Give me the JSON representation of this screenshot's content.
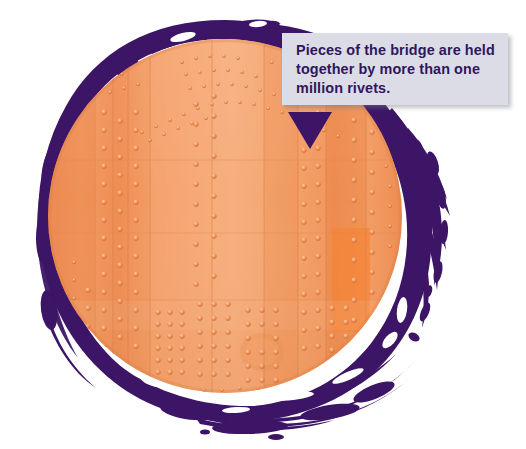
{
  "image": {
    "width": 526,
    "height": 449,
    "background_color": "#ffffff",
    "subject": "circular photo of riveted orange-painted bridge steel plating"
  },
  "callout": {
    "name": "fact-callout",
    "text": "Pieces of the bridge are held together by more than one million rivets.",
    "text_color": "#30175c",
    "background_color": "#dcdce7",
    "box": {
      "x": 282,
      "y": 33,
      "width": 226,
      "height": 72
    },
    "pointer": {
      "name": "callout-pointer-triangle",
      "color": "#3d1566",
      "direction": "down",
      "x": 288,
      "y": 112,
      "width": 44,
      "height": 37
    }
  },
  "artwork": {
    "circle_photo": {
      "name": "riveted-steel-photo",
      "center_x": 225,
      "center_y": 216,
      "radius": 177,
      "base_color": "#f19058",
      "highlight_color": "#f8b189",
      "shadow_color": "#e87c42",
      "rivet_color": "#f6a571",
      "rivet_shadow": "#d1703a"
    },
    "paint_ring": {
      "name": "purple-paint-ring",
      "color": "#3d1566",
      "style": "rough hand-painted brush stroke with splashes and gaps"
    }
  }
}
